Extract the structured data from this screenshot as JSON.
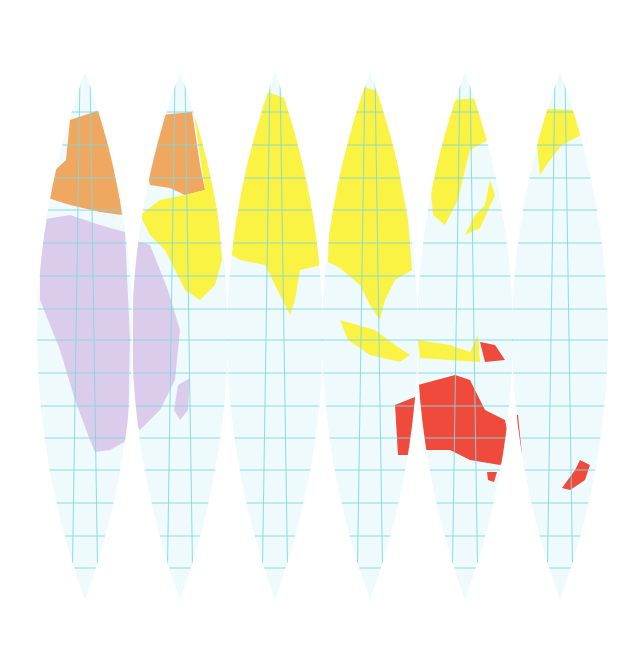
{
  "map": {
    "type": "globe-gores",
    "gore_count": 6,
    "colors": {
      "ocean": "#eefafc",
      "grid": "#7fd8e0",
      "europe": "#f0a860",
      "africa": "#dcccec",
      "asia": "#fbf343",
      "oceania": "#ef4a3c"
    },
    "legend": [
      {
        "region": "Europe",
        "color": "#f0a860"
      },
      {
        "region": "Africa",
        "color": "#dcccec"
      },
      {
        "region": "Asia",
        "color": "#fbf343"
      },
      {
        "region": "Oceania",
        "color": "#ef4a3c"
      }
    ],
    "gores": [
      {
        "index": 1,
        "cx": 85,
        "regions": [
          "Europe",
          "Africa"
        ]
      },
      {
        "index": 2,
        "cx": 180,
        "regions": [
          "Europe",
          "Asia",
          "Africa"
        ]
      },
      {
        "index": 3,
        "cx": 275,
        "regions": [
          "Asia"
        ]
      },
      {
        "index": 4,
        "cx": 370,
        "regions": [
          "Asia",
          "Oceania"
        ]
      },
      {
        "index": 5,
        "cx": 465,
        "regions": [
          "Asia",
          "Oceania"
        ]
      },
      {
        "index": 6,
        "cx": 560,
        "regions": [
          "Asia",
          "Oceania"
        ]
      }
    ],
    "graticule_rows": 16
  }
}
